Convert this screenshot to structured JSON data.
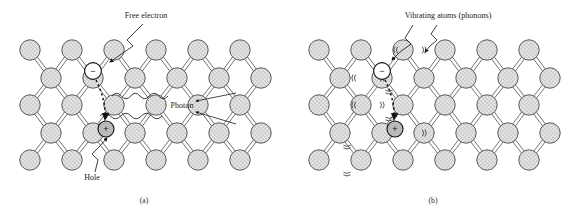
{
  "figure": {
    "title_visible": false,
    "background": "#ffffff",
    "atom_fill": "#dcdcdc",
    "atom_stroke": "#5a5a5a",
    "bond_stroke": "#6b6b6b",
    "ink": "#1b1b1b"
  },
  "panels": [
    {
      "id": "a",
      "caption": "(a)",
      "caption_pos": [
        144,
        203
      ],
      "origin": [
        0,
        0
      ],
      "labels": [
        {
          "name": "free-electron-label",
          "text": "Free electron",
          "x": 146,
          "y": 18,
          "anchor": "middle"
        },
        {
          "name": "photon-label",
          "text": "Photon",
          "x": 182,
          "y": 108,
          "anchor": "middle"
        },
        {
          "name": "hole-label",
          "text": "Hole",
          "x": 92,
          "y": 180,
          "anchor": "middle"
        }
      ],
      "carriers": [
        {
          "name": "electron-symbol",
          "sign": "−",
          "cx": 93,
          "cy": 71,
          "r": 8.4
        },
        {
          "name": "hole-symbol",
          "sign": "+",
          "cx": 106,
          "cy": 129,
          "r": 8.0,
          "filled": true
        }
      ],
      "recombination_arrow": {
        "name": "recombination-arrow",
        "path": "M 96 80 C 103 94 106 108 105 119"
      },
      "leaders": [
        {
          "name": "free-electron-leader",
          "path": "M 143 24 L 127 40 L 133 46 L 120 55 L 110 62"
        },
        {
          "name": "hole-leader",
          "path": "M 95 172 L 98 160 L 92 154 L 100 146 L 107 138"
        }
      ],
      "photon_waves": [
        {
          "name": "photon-wave-upper",
          "path": "M 112 102 L 116 92 L 166 92 L 166 92"
        },
        {
          "name": "photon-wave-lower",
          "path": "M 103 122 L 108 112 L 160 112"
        }
      ],
      "vibrations": []
    },
    {
      "id": "b",
      "caption": "(b)",
      "caption_pos": [
        433,
        203
      ],
      "origin": [
        289,
        0
      ],
      "labels": [
        {
          "name": "vibrating-atoms-label",
          "text": "Vibrating atoms (phonons)",
          "x": 448,
          "y": 18,
          "anchor": "middle"
        }
      ],
      "carriers": [
        {
          "name": "electron-symbol",
          "sign": "−",
          "cx": 382,
          "cy": 71,
          "r": 8.4
        },
        {
          "name": "hole-symbol",
          "sign": "+",
          "cx": 395,
          "cy": 129,
          "r": 8.0,
          "filled": true
        }
      ],
      "recombination_arrow": {
        "name": "recombination-arrow",
        "path": "M 385 80 C 392 94 395 108 394 119"
      },
      "leaders": [
        {
          "name": "vibrating-atoms-leader-left",
          "path": "M 413 25 L 405 38 L 411 44 L 400 52 L 392 60"
        },
        {
          "name": "vibrating-atoms-leader-right",
          "path": "M 437 25 L 431 34 L 437 40 L 430 46 L 425 52"
        }
      ],
      "photon_waves": [],
      "vibrations": [
        {
          "name": "vibration-mark",
          "cx": 410,
          "cy": 50,
          "sides": true,
          "below": false
        },
        {
          "name": "vibration-mark",
          "cx": 368,
          "cy": 78,
          "sides": true,
          "below": false
        },
        {
          "name": "vibration-mark",
          "cx": 389,
          "cy": 78,
          "sides": false,
          "below": true
        },
        {
          "name": "vibration-mark",
          "cx": 368,
          "cy": 105,
          "sides": true,
          "below": false
        },
        {
          "name": "vibration-mark",
          "cx": 389,
          "cy": 105,
          "sides": false,
          "below": true
        },
        {
          "name": "vibration-mark",
          "cx": 347,
          "cy": 133,
          "sides": false,
          "below": true
        },
        {
          "name": "vibration-mark",
          "cx": 410,
          "cy": 133,
          "sides": true,
          "below": false
        },
        {
          "name": "vibration-mark",
          "cx": 347,
          "cy": 160,
          "sides": false,
          "below": true
        }
      ]
    }
  ],
  "lattice": {
    "description": "diamond-cubic schematic, double-line covalent bonds",
    "atom_radius": 10.2,
    "col_step": 21.0,
    "row_y": [
      50,
      78,
      105,
      133,
      160
    ],
    "rows": [
      {
        "y": 50,
        "x_start": 30,
        "count": 6,
        "step": 42
      },
      {
        "y": 78,
        "x_start": 51,
        "count": 6,
        "step": 42
      },
      {
        "y": 105,
        "x_start": 30,
        "count": 6,
        "step": 42
      },
      {
        "y": 133,
        "x_start": 51,
        "count": 6,
        "step": 42
      },
      {
        "y": 160,
        "x_start": 30,
        "count": 6,
        "step": 42
      }
    ],
    "bond_pairs": "each atom links diagonally to neighbours in the row above/below"
  },
  "chart_data": {
    "type": "diagram",
    "panels": [
      {
        "label": "(a)",
        "mechanism": "radiative recombination",
        "annotations": [
          "Free electron",
          "Photon",
          "Hole"
        ],
        "carriers": [
          "electron",
          "hole"
        ],
        "emission": "photon (two wavy arrows)"
      },
      {
        "label": "(b)",
        "mechanism": "non-radiative recombination",
        "annotations": [
          "Vibrating atoms (phonons)"
        ],
        "carriers": [
          "electron",
          "hole"
        ],
        "emission": "phonons (lattice vibrations)"
      }
    ]
  }
}
